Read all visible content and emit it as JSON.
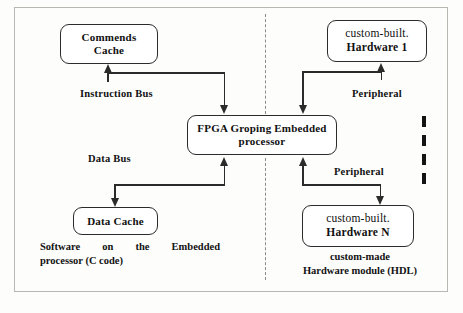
{
  "figure": {
    "nodes": {
      "commends_cache": {
        "line1": "Commends",
        "line2": "Cache"
      },
      "hardware_1": {
        "line1": "custom-built.",
        "line2": "Hardware 1"
      },
      "processor": {
        "line1": "FPGA Groping  Embedded",
        "line2": "processor"
      },
      "data_cache": {
        "line1": "Data  Cache"
      },
      "hardware_n": {
        "line1": "custom-built.",
        "line2": "Hardware N"
      }
    },
    "labels": {
      "instruction_bus": "Instruction Bus",
      "data_bus": "Data  Bus",
      "peripheral_top": "Peripheral",
      "peripheral_bottom": "Peripheral"
    },
    "captions": {
      "software_line1": "Software   on   the   Embedded",
      "software_line2": "processor (C code)",
      "hardware_line1": "custom-made",
      "hardware_line2": "Hardware module (HDL)"
    },
    "ellipsis": "vertical-continuation-dots",
    "colors": {
      "stroke": "#2b2b2b",
      "text": "#121212",
      "frame": "#b9b7b2",
      "divider": "#8d8b88",
      "background": "#fdfdfc"
    }
  }
}
